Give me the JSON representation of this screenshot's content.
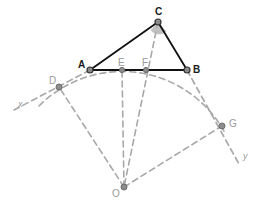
{
  "figure": {
    "width": 266,
    "height": 207,
    "background_color": "#ffffff"
  },
  "colors": {
    "triangle_stroke": "#111111",
    "dashed_stroke": "#a8a8a8",
    "arc_stroke": "#a8a8a8",
    "point_fill": "#8c8c8c",
    "point_stroke": "#4d4d4d",
    "label_dark": "#1a1a1a",
    "label_soft": "#9a9a9a",
    "angle_wedge_fill": "#b3b3b3"
  },
  "points": [
    {
      "id": "A",
      "label": "A",
      "x": 90,
      "y": 70,
      "label_x": 78,
      "label_y": 60,
      "style": "dark",
      "radius": 3.0
    },
    {
      "id": "B",
      "label": "B",
      "x": 187,
      "y": 70,
      "label_x": 193,
      "label_y": 65,
      "style": "dark",
      "radius": 3.0
    },
    {
      "id": "C",
      "label": "C",
      "x": 158,
      "y": 22,
      "label_x": 155,
      "label_y": 7,
      "style": "dark",
      "radius": 3.0
    },
    {
      "id": "D",
      "label": "D",
      "x": 59,
      "y": 87,
      "label_x": 49,
      "label_y": 76,
      "style": "soft",
      "radius": 3.0
    },
    {
      "id": "E",
      "label": "E",
      "x": 122,
      "y": 70,
      "label_x": 118,
      "label_y": 58,
      "style": "soft",
      "radius": 2.6
    },
    {
      "id": "F",
      "label": "F",
      "x": 146,
      "y": 70,
      "label_x": 142,
      "label_y": 58,
      "style": "soft",
      "radius": 2.6
    },
    {
      "id": "G",
      "label": "G",
      "x": 222,
      "y": 126,
      "label_x": 229,
      "label_y": 119,
      "style": "soft",
      "radius": 3.0
    },
    {
      "id": "O",
      "label": "O",
      "x": 124,
      "y": 187,
      "label_x": 112,
      "label_y": 189,
      "style": "soft",
      "radius": 3.0
    }
  ],
  "axis_labels": [
    {
      "id": "x",
      "label": "x",
      "x": 18,
      "y": 100
    },
    {
      "id": "y",
      "label": "y",
      "x": 243,
      "y": 152
    }
  ],
  "segments": {
    "triangle": [
      {
        "id": "AB",
        "from": "A",
        "to": "B"
      },
      {
        "id": "AC",
        "from": "A",
        "to": "C"
      },
      {
        "id": "CB",
        "from": "C",
        "to": "B"
      }
    ],
    "radii": [
      {
        "id": "OD",
        "from": "O",
        "to": "D"
      },
      {
        "id": "OE",
        "from": "O",
        "to": "E"
      },
      {
        "id": "OG",
        "from": "O",
        "to": "G"
      }
    ],
    "cevian": {
      "id": "C-F-O",
      "from": "C",
      "through": "F",
      "to": "O"
    },
    "rays": [
      {
        "id": "ray-A-D-x",
        "from": "A",
        "through": "D",
        "to_label": "x",
        "end_x": 14,
        "end_y": 110
      },
      {
        "id": "ray-B-G-y",
        "from": "B",
        "through": "G",
        "to_label": "y",
        "end_x": 239,
        "end_y": 164
      }
    ]
  },
  "arc": {
    "id": "main-arc",
    "center_x": 124,
    "center_y": 187,
    "radius": 117,
    "start_x": 39,
    "start_y": 106,
    "end_x": 225,
    "end_y": 133,
    "note": "arc through D, A, E, F, B, G centered at O"
  },
  "angle_marker": {
    "id": "angle-at-C",
    "vertex": "C",
    "radius": 11,
    "fill": "#b3b3b3",
    "opacity": 0.75
  },
  "dash_pattern": "6,4"
}
